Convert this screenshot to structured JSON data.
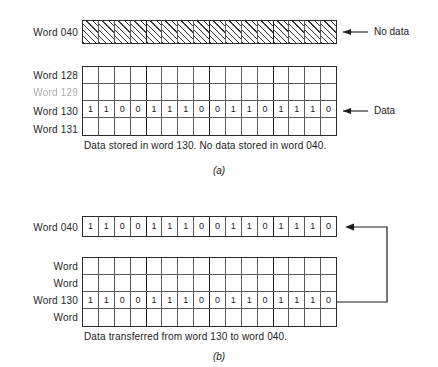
{
  "figure": {
    "panels": [
      {
        "id": "a",
        "panel_label": "(a)",
        "caption": "Data stored in word 130. No data stored in word 040.",
        "top_row": {
          "label": "Word 040",
          "fill": "hatched",
          "bits": [
            "",
            "",
            "",
            "",
            "",
            "",
            "",
            "",
            "",
            "",
            "",
            "",
            "",
            "",
            "",
            ""
          ],
          "annotation": "No data",
          "annotation_icon": "left-arrow-icon"
        },
        "memory_block": {
          "rows": [
            {
              "label": "Word 128",
              "bits": [
                "",
                "",
                "",
                "",
                "",
                "",
                "",
                "",
                "",
                "",
                "",
                "",
                "",
                "",
                "",
                ""
              ]
            },
            {
              "label": "Word 129",
              "faded": true,
              "bits": [
                "",
                "",
                "",
                "",
                "",
                "",
                "",
                "",
                "",
                "",
                "",
                "",
                "",
                "",
                "",
                ""
              ]
            },
            {
              "label": "Word 130",
              "bits": [
                "1",
                "1",
                "0",
                "0",
                "1",
                "1",
                "1",
                "0",
                "0",
                "1",
                "1",
                "0",
                "1",
                "1",
                "1",
                "0"
              ],
              "annotation": "Data",
              "annotation_icon": "left-arrow-icon"
            },
            {
              "label": "Word 131",
              "bits": [
                "",
                "",
                "",
                "",
                "",
                "",
                "",
                "",
                "",
                "",
                "",
                "",
                "",
                "",
                "",
                ""
              ]
            }
          ]
        }
      },
      {
        "id": "b",
        "panel_label": "(b)",
        "caption": "Data transferred from word 130 to word 040.",
        "top_row": {
          "label": "Word 040",
          "fill": "none",
          "bits": [
            "1",
            "1",
            "0",
            "0",
            "1",
            "1",
            "1",
            "0",
            "0",
            "1",
            "1",
            "0",
            "1",
            "1",
            "1",
            "0"
          ],
          "annotation": "",
          "annotation_icon": "transfer-arrow-icon"
        },
        "memory_block": {
          "rows": [
            {
              "label": "Word",
              "bits": [
                "",
                "",
                "",
                "",
                "",
                "",
                "",
                "",
                "",
                "",
                "",
                "",
                "",
                "",
                "",
                ""
              ]
            },
            {
              "label": "Word",
              "bits": [
                "",
                "",
                "",
                "",
                "",
                "",
                "",
                "",
                "",
                "",
                "",
                "",
                "",
                "",
                "",
                ""
              ]
            },
            {
              "label": "Word 130",
              "bits": [
                "1",
                "1",
                "0",
                "0",
                "1",
                "1",
                "1",
                "0",
                "0",
                "1",
                "1",
                "0",
                "1",
                "1",
                "1",
                "0"
              ]
            },
            {
              "label": "Word",
              "bits": [
                "",
                "",
                "",
                "",
                "",
                "",
                "",
                "",
                "",
                "",
                "",
                "",
                "",
                "",
                "",
                ""
              ]
            }
          ]
        }
      }
    ],
    "bits_per_word": 16,
    "nibble_size": 4,
    "colors": {
      "ink": "#1a1a1a",
      "grid_line": "#5a5a5a",
      "grid_major": "#1a1a1a",
      "faded_text": "#adadad",
      "background": "#ffffff"
    }
  }
}
